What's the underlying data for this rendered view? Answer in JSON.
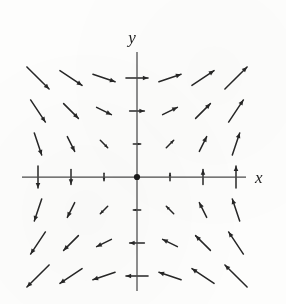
{
  "figure": {
    "title": "",
    "kind": "vector-field",
    "background_color": "#fdfdfc",
    "arrow_color": "#262626",
    "axis_color": "#4a4a4a"
  },
  "axes": {
    "x_label": "x",
    "y_label": "y",
    "origin_px": [
      137,
      177
    ],
    "spacing_px": 33,
    "x_axis_extent_px": [
      22,
      246
    ],
    "y_axis_extent_px": [
      52,
      291
    ],
    "tick_labels_visible": false
  },
  "chart_data": {
    "type": "scatter",
    "subtype": "quiver",
    "title": "",
    "xlabel": "x",
    "ylabel": "y",
    "xlim": [
      -3.5,
      3.5
    ],
    "ylim": [
      -3.5,
      3.5
    ],
    "grid": false,
    "legend": "none",
    "field_formula": "F(x, y) = (y, x)",
    "x": [
      -3,
      -2,
      -1,
      0,
      1,
      2,
      3
    ],
    "y": [
      -3,
      -2,
      -1,
      0,
      1,
      2,
      3
    ],
    "vectors": [
      {
        "x": -3,
        "y": 3,
        "u": 3,
        "v": -3
      },
      {
        "x": -2,
        "y": 3,
        "u": 3,
        "v": -2
      },
      {
        "x": -1,
        "y": 3,
        "u": 3,
        "v": -1
      },
      {
        "x": 0,
        "y": 3,
        "u": 3,
        "v": 0
      },
      {
        "x": 1,
        "y": 3,
        "u": 3,
        "v": 1
      },
      {
        "x": 2,
        "y": 3,
        "u": 3,
        "v": 2
      },
      {
        "x": 3,
        "y": 3,
        "u": 3,
        "v": 3
      },
      {
        "x": -3,
        "y": 2,
        "u": 2,
        "v": -3
      },
      {
        "x": -2,
        "y": 2,
        "u": 2,
        "v": -2
      },
      {
        "x": -1,
        "y": 2,
        "u": 2,
        "v": -1
      },
      {
        "x": 0,
        "y": 2,
        "u": 2,
        "v": 0
      },
      {
        "x": 1,
        "y": 2,
        "u": 2,
        "v": 1
      },
      {
        "x": 2,
        "y": 2,
        "u": 2,
        "v": 2
      },
      {
        "x": 3,
        "y": 2,
        "u": 2,
        "v": 3
      },
      {
        "x": -3,
        "y": 1,
        "u": 1,
        "v": -3
      },
      {
        "x": -2,
        "y": 1,
        "u": 1,
        "v": -2
      },
      {
        "x": -1,
        "y": 1,
        "u": 1,
        "v": -1
      },
      {
        "x": 0,
        "y": 1,
        "u": 1,
        "v": 0
      },
      {
        "x": 1,
        "y": 1,
        "u": 1,
        "v": 1
      },
      {
        "x": 2,
        "y": 1,
        "u": 1,
        "v": 2
      },
      {
        "x": 3,
        "y": 1,
        "u": 1,
        "v": 3
      },
      {
        "x": -3,
        "y": 0,
        "u": 0,
        "v": -3
      },
      {
        "x": -2,
        "y": 0,
        "u": 0,
        "v": -2
      },
      {
        "x": -1,
        "y": 0,
        "u": 0,
        "v": -1
      },
      {
        "x": 0,
        "y": 0,
        "u": 0,
        "v": 0
      },
      {
        "x": 1,
        "y": 0,
        "u": 0,
        "v": 1
      },
      {
        "x": 2,
        "y": 0,
        "u": 0,
        "v": 2
      },
      {
        "x": 3,
        "y": 0,
        "u": 0,
        "v": 3
      },
      {
        "x": -3,
        "y": -1,
        "u": -1,
        "v": -3
      },
      {
        "x": -2,
        "y": -1,
        "u": -1,
        "v": -2
      },
      {
        "x": -1,
        "y": -1,
        "u": -1,
        "v": -1
      },
      {
        "x": 0,
        "y": -1,
        "u": -1,
        "v": 0
      },
      {
        "x": 1,
        "y": -1,
        "u": -1,
        "v": 1
      },
      {
        "x": 2,
        "y": -1,
        "u": -1,
        "v": 2
      },
      {
        "x": 3,
        "y": -1,
        "u": -1,
        "v": 3
      },
      {
        "x": -3,
        "y": -2,
        "u": -2,
        "v": -3
      },
      {
        "x": -2,
        "y": -2,
        "u": -2,
        "v": -2
      },
      {
        "x": -1,
        "y": -2,
        "u": -2,
        "v": -1
      },
      {
        "x": 0,
        "y": -2,
        "u": -2,
        "v": 0
      },
      {
        "x": 1,
        "y": -2,
        "u": -2,
        "v": 1
      },
      {
        "x": 2,
        "y": -2,
        "u": -2,
        "v": 2
      },
      {
        "x": 3,
        "y": -2,
        "u": -2,
        "v": 3
      },
      {
        "x": -3,
        "y": -3,
        "u": -3,
        "v": -3
      },
      {
        "x": -2,
        "y": -3,
        "u": -3,
        "v": -2
      },
      {
        "x": -1,
        "y": -3,
        "u": -3,
        "v": -1
      },
      {
        "x": 0,
        "y": -3,
        "u": -3,
        "v": 0
      },
      {
        "x": 1,
        "y": -3,
        "u": -3,
        "v": 1
      },
      {
        "x": 2,
        "y": -3,
        "u": -3,
        "v": 2
      },
      {
        "x": 3,
        "y": -3,
        "u": -3,
        "v": 3
      }
    ]
  }
}
